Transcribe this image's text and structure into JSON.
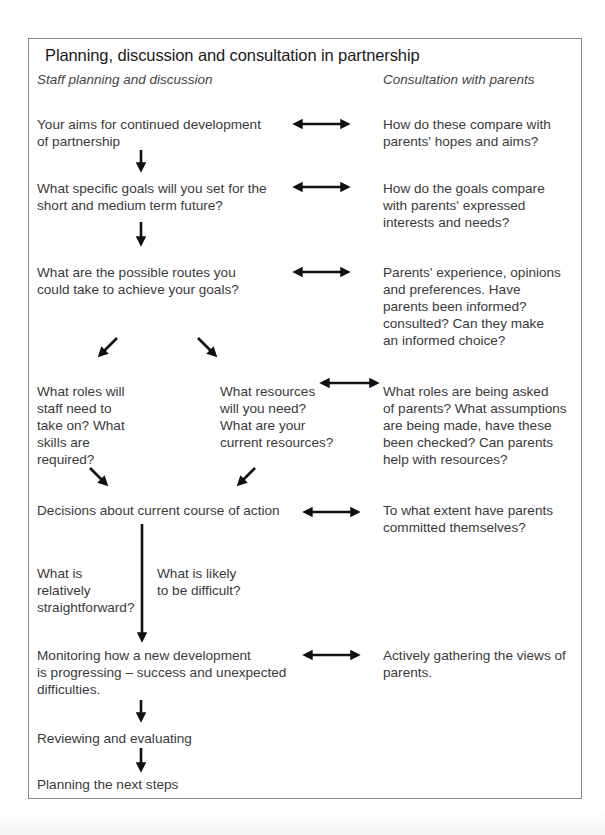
{
  "title": "Planning, discussion and consultation in partnership",
  "columns": {
    "left_heading": "Staff planning and discussion",
    "right_heading": "Consultation with parents"
  },
  "rows": [
    {
      "staff": "Your aims for continued development\nof partnership",
      "parents": "How do these compare with\nparents' hopes and aims?"
    },
    {
      "staff": "What specific goals will you set for the\nshort and medium term future?",
      "parents": "How do the goals compare\nwith parents' expressed\ninterests and needs?"
    },
    {
      "staff": "What are the possible routes you\ncould take to achieve your goals?",
      "parents": "Parents' experience, opinions\nand preferences. Have\nparents been informed?\nconsulted? Can they make\nan informed choice?"
    },
    {
      "staff_roles": "What roles will\nstaff need to\ntake on? What\nskills are\nrequired?",
      "staff_resources": "What resources\nwill you need?\nWhat are your\ncurrent resources?",
      "parents": "What roles are being asked\nof parents? What assumptions\nare being made, have these\nbeen checked? Can parents\nhelp with resources?"
    },
    {
      "staff": "Decisions about current course of action",
      "parents": "To what extent have parents\ncommitted themselves?"
    },
    {
      "staff_easy": "What is\nrelatively\nstraightforward?",
      "staff_hard": "What is likely\nto be difficult?"
    },
    {
      "staff": "Monitoring how a new development\nis progressing – success and unexpected\ndifficulties.",
      "parents": "Actively gathering the views of\nparents."
    },
    {
      "staff": "Reviewing and evaluating"
    },
    {
      "staff": "Planning the next steps"
    }
  ],
  "colors": {
    "text": "#3a3a3a",
    "title": "#1a1a1a",
    "arrow": "#111111",
    "frame": "#8a8a8a"
  },
  "icons": {
    "double_arrow": "bidirectional-arrow",
    "down_arrow": "down-arrow",
    "diagonal_arrow": "diagonal-arrow"
  }
}
